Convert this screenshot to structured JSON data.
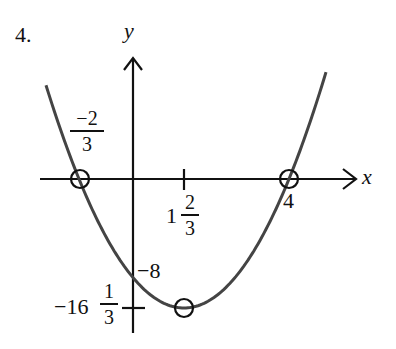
{
  "problem_number": "4.",
  "chart_data": {
    "type": "line",
    "title": "",
    "xlabel": "x",
    "ylabel": "y",
    "function": "quadratic (parabola opening upward)",
    "x_intercepts": [
      {
        "label_num": "−2",
        "label_den": "3",
        "value": -0.6667
      },
      {
        "label": "4",
        "value": 4
      }
    ],
    "y_intercept": {
      "label": "−8",
      "value": -8
    },
    "vertex": {
      "x_whole": "1",
      "x_num": "2",
      "x_den": "3",
      "x": 1.6667,
      "y_whole": "−16",
      "y_num": "1",
      "y_den": "3",
      "y": -16.3333
    },
    "marked_points": [
      "x-intercept left",
      "x-intercept right",
      "vertex"
    ],
    "grid": false,
    "legend": null
  },
  "labels": {
    "y_axis": "y",
    "x_axis": "x",
    "root_left_num": "−2",
    "root_left_den": "3",
    "root_right": "4",
    "vertex_x_whole": "1",
    "vertex_x_num": "2",
    "vertex_x_den": "3",
    "y_int": "−8",
    "vertex_y_whole": "−16",
    "vertex_y_num": "1",
    "vertex_y_den": "3"
  },
  "colors": {
    "axes": "#111111",
    "curve": "#444444",
    "marker": "#111111"
  }
}
